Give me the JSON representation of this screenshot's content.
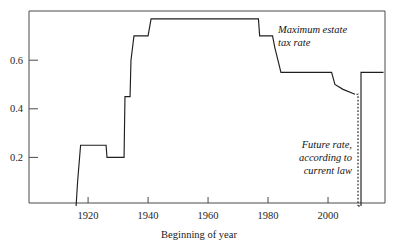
{
  "chart_data": {
    "type": "line",
    "title": "",
    "subtitle": "",
    "xlabel": "Beginning of year",
    "ylabel": "",
    "xlim": [
      1900.3,
      2019.0
    ],
    "ylim": [
      0.0,
      0.79
    ],
    "grid": false,
    "legend": "none",
    "xticks": [
      1920,
      1940,
      1960,
      1980,
      2000
    ],
    "xtick_labels": [
      "1920",
      "1940",
      "1960",
      "1980",
      "2000"
    ],
    "yticks": [
      0.2,
      0.4,
      0.6
    ],
    "ytick_labels": [
      "0.2",
      "0.4",
      "0.6"
    ],
    "series": [
      {
        "name": "Maximum estate tax rate",
        "style": "solid",
        "points": [
          [
            1916.0,
            0.0
          ],
          [
            1916.5,
            0.1
          ],
          [
            1917.5,
            0.25
          ],
          [
            1926.0,
            0.25
          ],
          [
            1926.3,
            0.2
          ],
          [
            1932.0,
            0.2
          ],
          [
            1932.3,
            0.45
          ],
          [
            1934.0,
            0.45
          ],
          [
            1934.3,
            0.6
          ],
          [
            1935.3,
            0.7
          ],
          [
            1940.0,
            0.7
          ],
          [
            1941.0,
            0.77
          ],
          [
            1976.8,
            0.77
          ],
          [
            1977.2,
            0.7
          ],
          [
            1981.5,
            0.7
          ],
          [
            1982.3,
            0.65
          ],
          [
            1983.3,
            0.6
          ],
          [
            1984.3,
            0.55
          ],
          [
            2001.2,
            0.55
          ],
          [
            2002.3,
            0.5
          ],
          [
            2005.0,
            0.48
          ],
          [
            2009.0,
            0.46
          ]
        ]
      },
      {
        "name": "Future rate, according to current law",
        "style": "dashed",
        "points": [
          [
            2009.5,
            0.46
          ],
          [
            2010.0,
            0.46
          ],
          [
            2010.0,
            0.0
          ]
        ]
      },
      {
        "name": "Future rate restored",
        "style": "dashed",
        "points": [
          [
            2010.0,
            0.0
          ],
          [
            2011.0,
            0.0
          ]
        ]
      },
      {
        "name": "Post-sunset rate",
        "style": "solid",
        "points": [
          [
            2011.0,
            0.0
          ],
          [
            2011.0,
            0.55
          ],
          [
            2018.5,
            0.55
          ]
        ]
      }
    ],
    "annotations": [
      {
        "id": "max-estate-tax-rate",
        "lines": [
          "Maximum estate",
          "tax rate"
        ],
        "x": 278,
        "y": 33,
        "anchor": "start"
      },
      {
        "id": "future-rate-current-law",
        "lines": [
          "Future rate,",
          "according to",
          "current law"
        ],
        "x": 352,
        "y": 148,
        "anchor": "end"
      }
    ]
  }
}
